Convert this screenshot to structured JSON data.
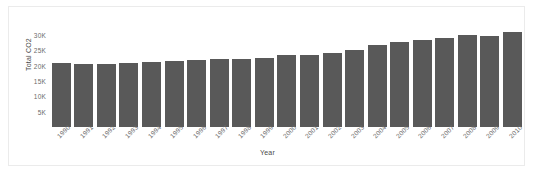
{
  "chart_data": {
    "type": "bar",
    "title": "",
    "xlabel": "Year",
    "ylabel": "Total CO2",
    "categories": [
      "1990",
      "1991",
      "1992",
      "1993",
      "1994",
      "1995",
      "1996",
      "1997",
      "1998",
      "1999",
      "2000",
      "2001",
      "2002",
      "2003",
      "2004",
      "2005",
      "2006",
      "2007",
      "2008",
      "2009",
      "2010"
    ],
    "values": [
      20800,
      20700,
      20700,
      20800,
      21100,
      21500,
      21900,
      22300,
      22300,
      22500,
      23400,
      23500,
      24100,
      25200,
      26700,
      27800,
      28400,
      29100,
      29900,
      29600,
      31000
    ],
    "series": [
      {
        "name": "Total CO2",
        "values": [
          20800,
          20700,
          20700,
          20800,
          21100,
          21500,
          21900,
          22300,
          22300,
          22500,
          23400,
          23500,
          24100,
          25200,
          26700,
          27800,
          28400,
          29100,
          29900,
          29600,
          31000
        ]
      }
    ],
    "ylim": [
      0,
      32000
    ],
    "yticks": [
      5000,
      10000,
      15000,
      20000,
      25000,
      30000
    ],
    "ytick_labels": [
      "5K",
      "10K",
      "15K",
      "20K",
      "25K",
      "30K"
    ],
    "grid": false,
    "legend": false,
    "bar_color": "#595959",
    "background_color": "#ffffff",
    "border_color": "#ebebeb",
    "tick_label_color": "#6b6b6b",
    "axis_title_color": "#4a4a4a"
  }
}
